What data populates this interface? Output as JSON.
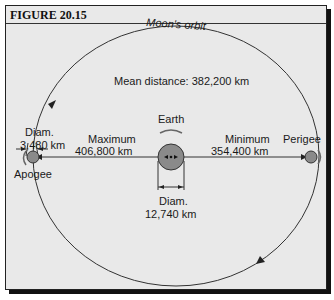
{
  "figure": {
    "title": "FIGURE 20.15"
  },
  "diagram": {
    "orbit_label": "Moon's orbit",
    "mean_distance": "Mean distance:  382,200 km",
    "earth": {
      "label": "Earth",
      "diam_label": "Diam.",
      "diam_value": "12,740 km"
    },
    "moon": {
      "diam_label": "Diam.",
      "diam_value": "3,480 km"
    },
    "maximum": {
      "label": "Maximum",
      "value": "406,800 km"
    },
    "minimum": {
      "label": "Minimum",
      "value": "354,400 km"
    },
    "apogee_label": "Apogee",
    "perigee_label": "Perigee",
    "colors": {
      "background": "#e9e9e9",
      "body_fill": "#8a8a8a",
      "line": "#333333"
    }
  }
}
